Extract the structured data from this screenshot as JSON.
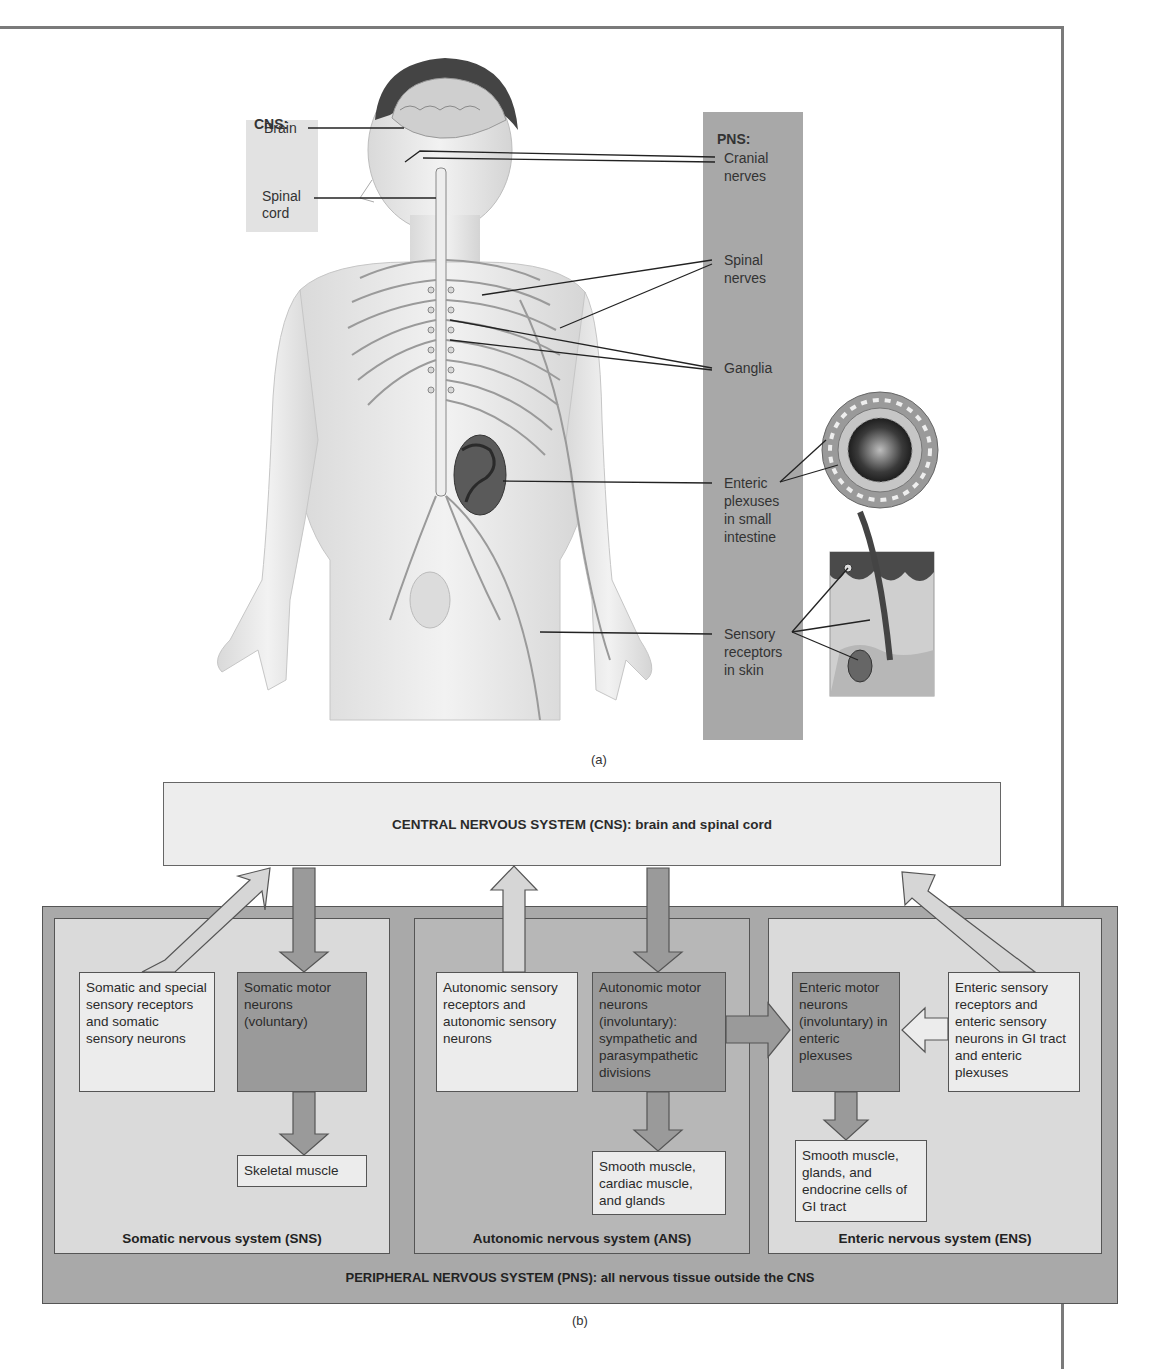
{
  "figure_a": {
    "caption": "(a)",
    "cns": {
      "heading": "CNS:",
      "brain": "Brain",
      "spinal_cord_line1": "Spinal",
      "spinal_cord_line2": "cord"
    },
    "pns": {
      "heading": "PNS:",
      "cranial_line1": "Cranial",
      "cranial_line2": "nerves",
      "spinal_line1": "Spinal",
      "spinal_line2": "nerves",
      "ganglia": "Ganglia",
      "enteric_line1": "Enteric",
      "enteric_line2": "plexuses",
      "enteric_line3": "in small",
      "enteric_line4": "intestine",
      "sensory_line1": "Sensory",
      "sensory_line2": "receptors",
      "sensory_line3": "in skin"
    }
  },
  "figure_b": {
    "caption": "(b)",
    "cns_box": "CENTRAL NERVOUS SYSTEM (CNS): brain and spinal cord",
    "pns_footer": "PERIPHERAL NERVOUS SYSTEM (PNS): all nervous tissue outside the CNS",
    "sns": {
      "title": "Somatic nervous system (SNS)",
      "sensory": "Somatic and special sensory receptors and somatic sensory neurons",
      "motor": "Somatic motor neurons (voluntary)",
      "effector": "Skeletal muscle"
    },
    "ans": {
      "title": "Autonomic nervous system (ANS)",
      "sensory": "Autonomic sensory receptors and autonomic sensory neurons",
      "motor": "Autonomic motor neurons (involuntary): sympathetic and parasympathetic divisions",
      "effector": "Smooth muscle, cardiac muscle, and glands"
    },
    "ens": {
      "title": "Enteric nervous system (ENS)",
      "motor": "Enteric motor neurons (involuntary) in enteric plexuses",
      "sensory": "Enteric sensory receptors and enteric sensory neurons in GI tract and enteric plexuses",
      "effector": "Smooth muscle, glands, and endocrine cells of GI tract"
    }
  },
  "colors": {
    "light_fill": "#ececec",
    "panel_light": "#dadada",
    "panel_mid": "#b7b7b7",
    "pns_outer": "#a9a9a9",
    "motor_dark": "#9a9a9a",
    "frame": "#7a7a7a"
  }
}
